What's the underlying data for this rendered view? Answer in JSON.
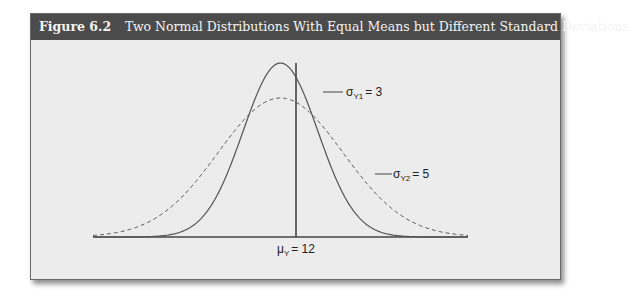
{
  "figure": {
    "number": "Figure 6.2",
    "title": "Two Normal Distributions With Equal Means but Different Standard Deviations"
  },
  "colors": {
    "header_bg": "#4b4b4b",
    "header_text": "#f4f4f4",
    "plot_bg": "#ececec",
    "curve": "#555555"
  },
  "labels": {
    "sigma1": {
      "symbol": "σ",
      "sub": "Y1",
      "value": "= 3"
    },
    "sigma2": {
      "symbol": "σ",
      "sub": "Y2",
      "value": "= 5"
    },
    "mean": {
      "symbol": "μ",
      "sub": "Y",
      "value": "= 12"
    }
  },
  "chart_data": {
    "type": "line",
    "title": "Two Normal Distributions With Equal Means but Different Standard Deviations",
    "xlabel": "",
    "ylabel": "",
    "grid": false,
    "legend_position": "inline annotations",
    "series": [
      {
        "name": "σY1 = 3",
        "distribution": "normal",
        "mean": 12,
        "sd": 3,
        "style": "solid"
      },
      {
        "name": "σY2 = 5",
        "distribution": "normal",
        "mean": 12,
        "sd": 5,
        "style": "dashed"
      }
    ],
    "annotations": [
      "σY1 = 3",
      "σY2 = 5",
      "μY = 12"
    ],
    "mean_line": {
      "x": 12,
      "label": "μY = 12"
    },
    "xlim": [
      -3,
      27
    ]
  }
}
